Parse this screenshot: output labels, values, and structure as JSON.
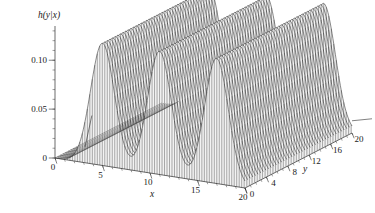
{
  "figure": {
    "kind": "3d-surface-plot",
    "background": "#ffffff",
    "ink_color": "#2b2b2b",
    "surface_shade": "#3c3c3c"
  },
  "chart_data": {
    "type": "line",
    "render_style": "3d mesh surface, grayscale vertical hatching",
    "title": "",
    "subtitle": "",
    "zlabel": "h(y|x)",
    "xlabel": "x",
    "ylabel": "y",
    "xlim": [
      0,
      20
    ],
    "ylim": [
      0,
      20
    ],
    "zlim": [
      0,
      0.135
    ],
    "grid": false,
    "legend": null,
    "legend_position": "none",
    "x_ticks": [
      0,
      5,
      10,
      15,
      20
    ],
    "x_ticklabels": [
      "0",
      "5",
      "10",
      "15",
      "20"
    ],
    "x_minor_tick_step": 1,
    "y_ticks": [
      0,
      4,
      8,
      12,
      16,
      20
    ],
    "y_ticklabels": [
      "0",
      "4",
      "8",
      "12",
      "16",
      "20"
    ],
    "y_minor_tick_step": 1,
    "z_ticks": [
      0,
      0.05,
      0.1
    ],
    "z_ticklabels": [
      "0",
      "0.05",
      "0.10"
    ],
    "z_minor_tick_step": 0.01,
    "ridges": [
      {
        "name": "ridge-1",
        "x_center": 5.0,
        "peak_height": 0.125,
        "x_sigma": 1.25
      },
      {
        "name": "ridge-2",
        "x_center": 11.0,
        "peak_height": 0.126,
        "x_sigma": 1.25
      },
      {
        "name": "ridge-3",
        "x_center": 17.0,
        "peak_height": 0.128,
        "x_sigma": 1.25
      }
    ],
    "series": [
      {
        "name": "h(y|x) ridge at x=5",
        "x": [
          0,
          1,
          2,
          3,
          4,
          5,
          6,
          7,
          8,
          9,
          10
        ],
        "values": [
          0.0,
          0.002,
          0.011,
          0.038,
          0.09,
          0.125,
          0.09,
          0.038,
          0.011,
          0.002,
          0.0
        ]
      },
      {
        "name": "h(y|x) ridge at x=11",
        "x": [
          6,
          7,
          8,
          9,
          10,
          11,
          12,
          13,
          14,
          15,
          16
        ],
        "values": [
          0.0,
          0.002,
          0.011,
          0.038,
          0.09,
          0.126,
          0.09,
          0.038,
          0.011,
          0.002,
          0.0
        ]
      },
      {
        "name": "h(y|x) ridge at x=17",
        "x": [
          12,
          13,
          14,
          15,
          16,
          17,
          18,
          19,
          20
        ],
        "values": [
          0.0,
          0.002,
          0.011,
          0.038,
          0.09,
          0.128,
          0.09,
          0.038,
          0.011
        ]
      }
    ]
  }
}
